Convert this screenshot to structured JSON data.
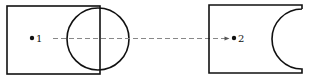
{
  "diagram": {
    "colors": {
      "stroke": "#111111",
      "dash": "#888888",
      "background": "#ffffff"
    },
    "left_shape": {
      "rect": {
        "x": 7,
        "y": 6,
        "width": 93,
        "height": 68
      },
      "circle": {
        "cx": 98,
        "cy": 39,
        "r": 31
      },
      "point": {
        "x": 32,
        "y": 38,
        "label": "1"
      }
    },
    "right_shape": {
      "outline": "rectangle with semicircular cutout on right side",
      "point": {
        "x": 234,
        "y": 38,
        "label": "2"
      }
    },
    "connector": {
      "style": "dashed",
      "from": "1",
      "to": "2",
      "arrow": true
    }
  }
}
